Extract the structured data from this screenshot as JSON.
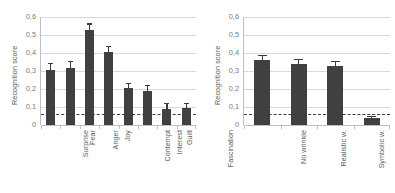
{
  "figure": {
    "background": "#ffffff",
    "bar_color": "#404040",
    "grid_color": "#d9d9d9",
    "axis_color": "#bfbfbf",
    "refline_color": "#3d3d3d",
    "text_color": "#595959"
  },
  "chart_data": [
    {
      "type": "bar",
      "panel": "left",
      "title": "",
      "xlabel": "",
      "ylabel": "Recognition score",
      "ylim": [
        0,
        0.6
      ],
      "ytick_labels": [
        "0,6",
        "0,5",
        "0,4",
        "0,3",
        "0,2",
        "0,1",
        "0"
      ],
      "ytick_values": [
        0.6,
        0.5,
        0.4,
        0.3,
        0.2,
        0.1,
        0
      ],
      "grid": true,
      "legend": "none",
      "categories": [
        "Surprise",
        "Fear",
        "Anger",
        "Joy",
        "Contempt",
        "Interest",
        "Guilt",
        "Fascination"
      ],
      "values": [
        0.303,
        0.318,
        0.527,
        0.408,
        0.203,
        0.191,
        0.091,
        0.093
      ],
      "errors": [
        0.041,
        0.04,
        0.037,
        0.031,
        0.03,
        0.031,
        0.029,
        0.027
      ],
      "reference_line": 0.06,
      "reference_line_style": "dashed"
    },
    {
      "type": "bar",
      "panel": "right",
      "title": "",
      "xlabel": "",
      "ylabel": "Recognition score",
      "ylim": [
        0,
        0.6
      ],
      "ytick_labels": [
        "0,6",
        "0,5",
        "0,4",
        "0,3",
        "0,2",
        "0,1",
        "0"
      ],
      "ytick_values": [
        0.6,
        0.5,
        0.4,
        0.3,
        0.2,
        0.1,
        0
      ],
      "grid": true,
      "legend": "none",
      "categories": [
        "No wrinkle",
        "Realistic w.",
        "Symbolic w.",
        "Wrinkles only"
      ],
      "values": [
        0.361,
        0.341,
        0.328,
        0.04
      ],
      "errors": [
        0.026,
        0.027,
        0.026,
        0.012
      ],
      "reference_line": 0.06,
      "reference_line_style": "dashed"
    }
  ],
  "left_panel": {
    "ylabel": "Recognition score",
    "yticks": [
      "0,6",
      "0,5",
      "0,4",
      "0,3",
      "0,2",
      "0,1",
      "0"
    ],
    "xticks": [
      "Surprise",
      "Fear",
      "Anger",
      "Joy",
      "Contempt",
      "Interest",
      "Guilt",
      "Fascination"
    ]
  },
  "right_panel": {
    "ylabel": "Recognition score",
    "yticks": [
      "0,6",
      "0,5",
      "0,4",
      "0,3",
      "0,2",
      "0,1",
      "0"
    ],
    "xticks": [
      "No wrinkle",
      "Realistic w.",
      "Symbolic w.",
      "Wrinkles only"
    ]
  }
}
